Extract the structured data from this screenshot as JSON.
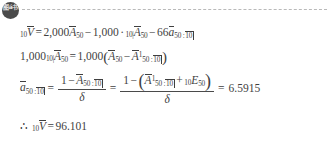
{
  "header": {
    "badge_text": "图á书",
    "badge_name": "document-logo-badge",
    "divider_style": "dashed"
  },
  "document": {
    "type": "actuarial-reserve-derivation",
    "background_color": "#ffffff",
    "text_color": "#3f3f3f",
    "lines": [
      {
        "id": "line-1",
        "plain": "10 V-bar = 2,000 A-bar_50 - 1,000 . 10| A-bar_50 - 66 a-bar_50:10|",
        "tokens": {
          "lhs_pre": "10",
          "lhs_var": "V",
          "eq": "=",
          "coef1": "2,000",
          "term1_var": "A",
          "term1_sub": "50",
          "minus1": "−",
          "coef2": "1,000",
          "dot": "·",
          "term2_pre": "10|",
          "term2_var": "A",
          "term2_sub": "50",
          "minus2": "−",
          "coef3": "66",
          "term3_var": "a",
          "term3_sub": "50 :",
          "term3_angle": "10"
        }
      },
      {
        "id": "line-2",
        "plain": "1,000 10| A-bar_50 = 1,000( A-bar_50 - A-bar^1_50:10| )",
        "tokens": {
          "coef1": "1,000",
          "lhs_pre": "10|",
          "lhs_var": "A",
          "lhs_sub": "50",
          "eq": "=",
          "coef2": "1,000",
          "open": "(",
          "term1_var": "A",
          "term1_sub": "50",
          "minus": "−",
          "term2_var": "A",
          "term2_sup": "1",
          "term2_sub": "50 :",
          "term2_angle": "10",
          "close": ")"
        }
      },
      {
        "id": "line-3",
        "plain": "a-bar_50:10| = (1 - A-bar_50:10|)/delta = (1 - (A-bar^1_50:10| + 10E_50))/delta = 6.5915",
        "tokens": {
          "lhs_var": "a",
          "lhs_sub": "50 :",
          "lhs_angle": "10",
          "eq1": "=",
          "frac1_num_one": "1",
          "frac1_num_minus": "−",
          "frac1_num_var": "A",
          "frac1_num_sub": "50 :",
          "frac1_num_angle": "10",
          "frac1_den": "δ",
          "eq2": "=",
          "frac2_num_one": "1",
          "frac2_num_minus": "−",
          "frac2_open": "(",
          "frac2_var": "A",
          "frac2_sup": "1",
          "frac2_sub": "50 :",
          "frac2_angle": "10",
          "frac2_plus": "+",
          "frac2_pre_e": "10",
          "frac2_evar": "E",
          "frac2_esub": "50",
          "frac2_close": ")",
          "frac2_den": "δ",
          "eq3": "=",
          "result": "6.5915"
        }
      },
      {
        "id": "line-4",
        "plain": "therefore 10 V-bar = 96.101",
        "tokens": {
          "therefore": "∴",
          "pre": "10",
          "var": "V",
          "eq": "=",
          "result": "96.101"
        }
      }
    ]
  }
}
